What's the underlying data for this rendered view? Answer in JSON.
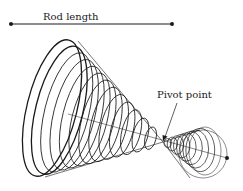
{
  "figure": {
    "kind": "conical pendulum trajectory sketch",
    "labels": {
      "rod_length": "Rod length",
      "pivot_point": "Pivot point"
    },
    "colors": {
      "stroke": "#1a1a1a",
      "background": "#ffffff"
    },
    "trajectory": {
      "upper_cone_loops": 13,
      "lower_cone_loops": 9
    }
  }
}
